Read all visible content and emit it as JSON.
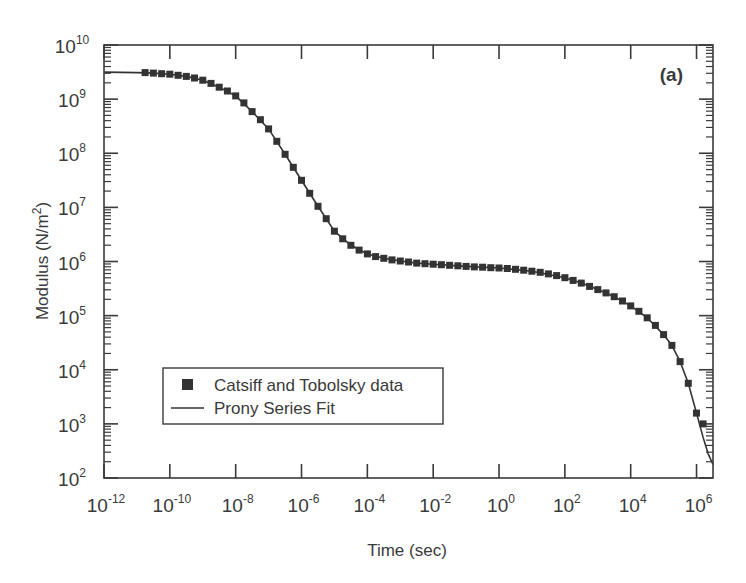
{
  "chart_data": {
    "type": "scatter",
    "title": "",
    "panel_label": "(a)",
    "xlabel": "Time (sec)",
    "ylabel": "Modulus (N/m^2)",
    "ylabel_parts": {
      "base": "Modulus (N/m",
      "sup": "2",
      "tail": ")"
    },
    "xscale": "log",
    "yscale": "log",
    "xlim_log10": [
      -12,
      6.5
    ],
    "ylim_log10": [
      2,
      10
    ],
    "x_ticks_log10": [
      -12,
      -10,
      -8,
      -6,
      -4,
      -2,
      0,
      2,
      4,
      6
    ],
    "y_ticks_log10": [
      2,
      3,
      4,
      5,
      6,
      7,
      8,
      9,
      10
    ],
    "grid": false,
    "legend": {
      "position": "lower-left",
      "entries": [
        {
          "label": "Catsiff and Tobolsky data",
          "marker": "square"
        },
        {
          "label": "Prony Series Fit",
          "marker": "line"
        }
      ]
    },
    "series": [
      {
        "name": "Prony Series Fit",
        "kind": "line",
        "log10_x": [
          -12,
          -11,
          -10.5,
          -10,
          -9.5,
          -9,
          -8.5,
          -8,
          -7.5,
          -7,
          -6.5,
          -6,
          -5.5,
          -5,
          -4.5,
          -4,
          -3.5,
          -3,
          -2.5,
          -2,
          -1,
          0,
          1,
          2,
          2.5,
          3,
          3.5,
          4,
          4.5,
          5,
          5.25,
          5.5,
          5.75,
          6,
          6.2,
          6.35,
          6.5
        ],
        "log10_y": [
          9.5,
          9.49,
          9.48,
          9.46,
          9.42,
          9.35,
          9.22,
          9.06,
          8.77,
          8.45,
          7.98,
          7.5,
          7.02,
          6.56,
          6.3,
          6.14,
          6.06,
          6.01,
          5.97,
          5.95,
          5.91,
          5.88,
          5.82,
          5.7,
          5.6,
          5.48,
          5.35,
          5.18,
          4.96,
          4.65,
          4.45,
          4.15,
          3.75,
          3.2,
          2.75,
          2.45,
          2.25
        ]
      },
      {
        "name": "Catsiff and Tobolsky data",
        "kind": "markers",
        "log10_x": [
          -10.75,
          -10.5,
          -10.25,
          -10,
          -9.75,
          -9.5,
          -9.25,
          -9,
          -8.75,
          -8.5,
          -8.25,
          -8,
          -7.75,
          -7.5,
          -7.25,
          -7,
          -6.75,
          -6.5,
          -6.25,
          -6,
          -5.75,
          -5.5,
          -5.25,
          -5,
          -4.75,
          -4.5,
          -4.25,
          -4,
          -3.75,
          -3.5,
          -3.25,
          -3,
          -2.75,
          -2.5,
          -2.25,
          -2,
          -1.75,
          -1.5,
          -1.25,
          -1,
          -0.75,
          -0.5,
          -0.25,
          0,
          0.25,
          0.5,
          0.75,
          1,
          1.25,
          1.5,
          1.75,
          2,
          2.25,
          2.5,
          2.75,
          3,
          3.25,
          3.5,
          3.75,
          4,
          4.25,
          4.5,
          4.75,
          5,
          5.25,
          5.5,
          5.75,
          6,
          6.2
        ],
        "log10_y": [
          9.49,
          9.48,
          9.47,
          9.46,
          9.44,
          9.42,
          9.39,
          9.35,
          9.29,
          9.22,
          9.15,
          9.06,
          8.93,
          8.77,
          8.62,
          8.45,
          8.22,
          7.98,
          7.74,
          7.5,
          7.26,
          7.02,
          6.79,
          6.56,
          6.42,
          6.3,
          6.21,
          6.14,
          6.09,
          6.06,
          6.03,
          6.01,
          5.99,
          5.97,
          5.96,
          5.95,
          5.94,
          5.93,
          5.92,
          5.91,
          5.9,
          5.895,
          5.885,
          5.88,
          5.87,
          5.855,
          5.84,
          5.82,
          5.8,
          5.77,
          5.74,
          5.7,
          5.65,
          5.6,
          5.54,
          5.48,
          5.42,
          5.35,
          5.27,
          5.18,
          5.08,
          4.96,
          4.82,
          4.65,
          4.45,
          4.15,
          3.75,
          3.2,
          3.0
        ]
      }
    ]
  },
  "colors": {
    "axis": "#3a3a3a",
    "line": "#333333",
    "marker": "#333333",
    "background": "#ffffff"
  }
}
